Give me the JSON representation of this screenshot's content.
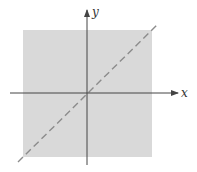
{
  "diagram": {
    "title": "",
    "region": {
      "x_min_px": 23,
      "y_min_px": 30,
      "x_max_px": 152,
      "y_max_px": 157,
      "fill_color": "#d9d9d9"
    },
    "axes": {
      "origin_px": [
        87,
        93
      ],
      "color": "#444444",
      "x_axis": {
        "label": "x",
        "from_px": [
          10,
          93
        ],
        "to_px": [
          178,
          93
        ]
      },
      "y_axis": {
        "label": "y",
        "from_px": [
          87,
          165
        ],
        "to_px": [
          87,
          10
        ]
      }
    },
    "line": {
      "description": "dashed diagonal y = x",
      "style": "dashed",
      "color": "#8c8c8c",
      "from_px": [
        18,
        162
      ],
      "to_px": [
        157,
        25
      ]
    }
  }
}
